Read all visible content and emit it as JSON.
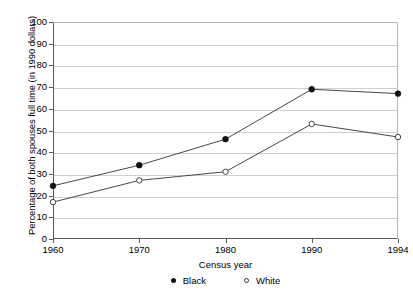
{
  "chart_data": {
    "type": "line",
    "title": "",
    "xlabel": "Census year",
    "ylabel": "Percentage of both spouses full time (in 1990 dollars)",
    "categories": [
      "1960",
      "1970",
      "1980",
      "1990",
      "1994"
    ],
    "ylim": [
      0,
      100
    ],
    "yticks": [
      "0",
      "10",
      "20",
      "30",
      "40",
      "50",
      "60",
      "70",
      "80",
      "90",
      "100"
    ],
    "grid": "horizontal",
    "legend_position": "bottom-center",
    "series": [
      {
        "name": "Black",
        "marker": "filled-circle",
        "color": "#111111",
        "values": [
          24.5,
          34,
          46,
          69,
          67
        ]
      },
      {
        "name": "White",
        "marker": "open-circle",
        "color": "#ffffff",
        "values": [
          17,
          27,
          31,
          53,
          47
        ]
      }
    ]
  },
  "legend": {
    "items": [
      {
        "label": "Black",
        "marker": "filled-circle"
      },
      {
        "label": "White",
        "marker": "open-circle"
      }
    ]
  },
  "colors": {
    "grid": "#cfcfcf",
    "axis": "#5a5a5a",
    "line": "#333333",
    "marker_filled": "#111111",
    "marker_open": "#ffffff"
  }
}
